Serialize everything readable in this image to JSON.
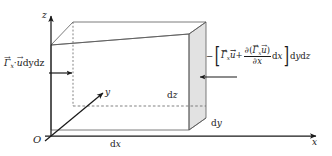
{
  "figure": {
    "type": "3d-control-volume-diagram",
    "colors": {
      "stroke": "#4a4a4a",
      "text": "#1a1a1a",
      "shaded_face": "#e2e2e2",
      "background": "#ffffff"
    }
  },
  "axes": {
    "origin_label": "O",
    "x_label": "x",
    "y_label": "y",
    "z_label": "z"
  },
  "dimensions": {
    "dx": {
      "d": "d",
      "var": "x"
    },
    "dy": {
      "d": "d",
      "var": "y"
    },
    "dz": {
      "d": "d",
      "var": "z"
    }
  },
  "labels": {
    "left_flux": {
      "gamma": "Γ",
      "gamma_sub": "x",
      "dot": "·",
      "u": "u",
      "vec_arrow": "→",
      "bar": "→",
      "dy": "dy",
      "dz": "dz",
      "plain": "Γ⃗x·u⃗ dydz"
    },
    "right_flux": {
      "minus": "−",
      "bracket_open": "[",
      "bracket_close": "]",
      "gamma": "Γ",
      "gamma_sub": "x",
      "u": "u",
      "plus": "+",
      "partial": "∂",
      "numerator_open": "(",
      "numerator_close": ")",
      "denominator_partial": "∂",
      "denominator_var": "x",
      "dx": "dx",
      "dydz": "dydz",
      "plain": "−[Γ⃗x·u⃗ + ∂(Γ⃗x u⃗)/∂x dx] dydz"
    }
  },
  "arrows": {
    "left_inflow": "arrow-right",
    "right_outflow": "arrow-left"
  }
}
